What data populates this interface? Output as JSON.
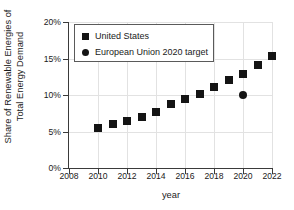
{
  "chart_data": {
    "type": "scatter",
    "title": "",
    "xlabel": "year",
    "ylabel": "Share of Renewable Energies of\nTotal Energy Demand",
    "xlim": [
      2008,
      2022
    ],
    "ylim": [
      0,
      20
    ],
    "xticks": [
      2008,
      2010,
      2012,
      2014,
      2016,
      2018,
      2020,
      2022
    ],
    "xticklabels": [
      "2008",
      "2010",
      "2012",
      "2014",
      "2016",
      "2018",
      "2020",
      "2022"
    ],
    "yticks": [
      0,
      5,
      10,
      15,
      20
    ],
    "yticklabels": [
      "0%",
      "5%",
      "10%",
      "15%",
      "20%"
    ],
    "grid": true,
    "legend_position": "upper left",
    "series": [
      {
        "name": "United States",
        "marker": "square",
        "color": "#141414",
        "x": [
          2010,
          2011,
          2012,
          2013,
          2014,
          2015,
          2016,
          2017,
          2018,
          2019,
          2020,
          2021,
          2022
        ],
        "y": [
          5.5,
          6.0,
          6.5,
          7.0,
          7.7,
          8.8,
          9.5,
          10.2,
          11.1,
          12.0,
          12.9,
          14.1,
          15.3
        ]
      },
      {
        "name": "European Union 2020 target",
        "marker": "circle",
        "color": "#141414",
        "x": [
          2020
        ],
        "y": [
          10.0
        ]
      }
    ]
  },
  "legend": {
    "items": [
      {
        "label": "United States",
        "marker": "square"
      },
      {
        "label": "European Union 2020 target",
        "marker": "circle"
      }
    ]
  }
}
